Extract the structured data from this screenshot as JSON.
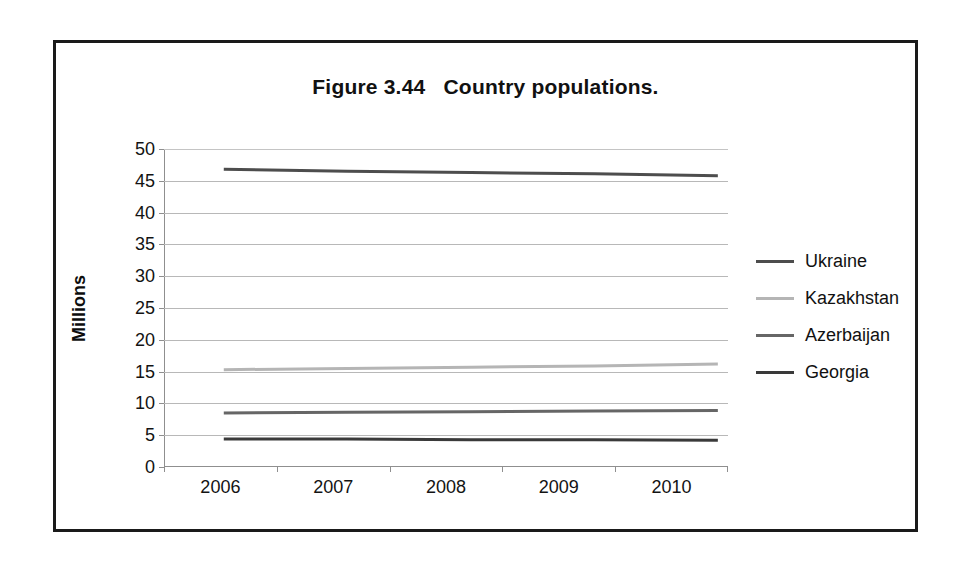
{
  "figure": {
    "title": "Figure 3.44   Country populations."
  },
  "chart_data": {
    "type": "line",
    "title": "Figure 3.44   Country populations.",
    "xlabel": "",
    "ylabel": "Millions",
    "categories": [
      "2006",
      "2007",
      "2008",
      "2009",
      "2010"
    ],
    "ylim": [
      0,
      50
    ],
    "yticks": [
      0,
      5,
      10,
      15,
      20,
      25,
      30,
      35,
      40,
      45,
      50
    ],
    "grid": true,
    "legend_position": "right",
    "series": [
      {
        "name": "Ukraine",
        "values": [
          46.8,
          46.5,
          46.3,
          46.1,
          45.8
        ],
        "color": "#4d4d4d"
      },
      {
        "name": "Kazakhstan",
        "values": [
          15.3,
          15.5,
          15.7,
          15.9,
          16.2
        ],
        "color": "#b5b5b5"
      },
      {
        "name": "Azerbaijan",
        "values": [
          8.5,
          8.6,
          8.7,
          8.8,
          8.9
        ],
        "color": "#666666"
      },
      {
        "name": "Georgia",
        "values": [
          4.4,
          4.4,
          4.3,
          4.3,
          4.2
        ],
        "color": "#3a3a3a"
      }
    ]
  },
  "legend": {
    "items": [
      {
        "label": "Ukraine"
      },
      {
        "label": "Kazakhstan"
      },
      {
        "label": "Azerbaijan"
      },
      {
        "label": "Georgia"
      }
    ]
  }
}
